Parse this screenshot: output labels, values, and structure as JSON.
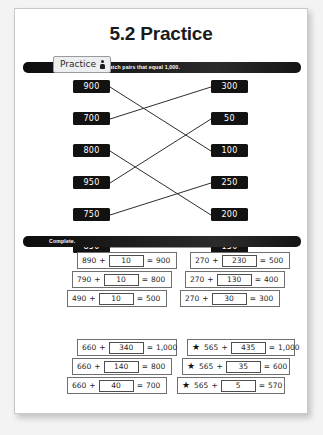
{
  "page": {
    "title": "5.2 Practice"
  },
  "activity_tab": {
    "label": "Practice",
    "icon": "person-icon"
  },
  "match_section": {
    "instruction": "Match pairs that equal 1,000.",
    "left_items": [
      "900",
      "700",
      "800",
      "950",
      "750",
      "850"
    ],
    "right_items": [
      "300",
      "50",
      "100",
      "250",
      "200",
      "150"
    ],
    "connections": [
      {
        "left": "900",
        "right": "100"
      },
      {
        "left": "700",
        "right": "300"
      },
      {
        "left": "800",
        "right": "200"
      },
      {
        "left": "950",
        "right": "50"
      },
      {
        "left": "750",
        "right": "250"
      },
      {
        "left": "850",
        "right": "150"
      }
    ]
  },
  "complete_section": {
    "instruction": "Complete.",
    "groups": [
      {
        "starred": false,
        "rows": [
          {
            "term": "890",
            "op": "+",
            "answer": "10",
            "eq": "=",
            "result": "900"
          },
          {
            "term": "790",
            "op": "+",
            "answer": "10",
            "eq": "=",
            "result": "800"
          },
          {
            "term": "490",
            "op": "+",
            "answer": "10",
            "eq": "=",
            "result": "500"
          }
        ]
      },
      {
        "starred": false,
        "rows": [
          {
            "term": "270",
            "op": "+",
            "answer": "230",
            "eq": "=",
            "result": "500"
          },
          {
            "term": "270",
            "op": "+",
            "answer": "130",
            "eq": "=",
            "result": "400"
          },
          {
            "term": "270",
            "op": "+",
            "answer": "30",
            "eq": "=",
            "result": "300"
          }
        ]
      },
      {
        "starred": false,
        "rows": [
          {
            "term": "660",
            "op": "+",
            "answer": "340",
            "eq": "=",
            "result": "1,000"
          },
          {
            "term": "660",
            "op": "+",
            "answer": "140",
            "eq": "=",
            "result": "800"
          },
          {
            "term": "660",
            "op": "+",
            "answer": "40",
            "eq": "=",
            "result": "700"
          }
        ]
      },
      {
        "starred": true,
        "star_glyph": "★",
        "rows": [
          {
            "term": "565",
            "op": "+",
            "answer": "435",
            "eq": "=",
            "result": "1,000"
          },
          {
            "term": "565",
            "op": "+",
            "answer": "35",
            "eq": "=",
            "result": "600"
          },
          {
            "term": "565",
            "op": "+",
            "answer": "5",
            "eq": "=",
            "result": "570"
          }
        ]
      }
    ]
  }
}
